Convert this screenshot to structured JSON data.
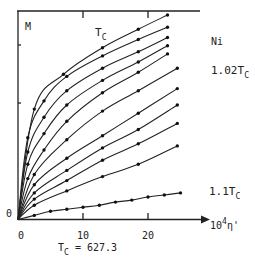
{
  "chart_data": {
    "type": "line",
    "title": "",
    "material_label": "Ni",
    "ylabel": "M",
    "xlabel": "10^4 η'",
    "xlabel_base": "10",
    "xlabel_exp": "4",
    "xlabel_var": "η'",
    "x_ticks": [
      "0",
      "10",
      "20"
    ],
    "y_ticks": [
      "0"
    ],
    "xlim": [
      0,
      27
    ],
    "annotation_tc": "T = 627.3",
    "annotation_tc_parts": {
      "T": "T",
      "sub": "C",
      "rest": " = 627.3"
    },
    "curve_labels": [
      {
        "text": "T",
        "sub": "C",
        "curve": "T_C"
      },
      {
        "text": "1.02T",
        "sub": "C",
        "curve": "1.02T_C"
      },
      {
        "text": "1.1T",
        "sub": "C",
        "curve": "1.1T_C"
      }
    ],
    "grid": false,
    "legend": "none",
    "series": [
      {
        "name": "T_C",
        "x": [
          0,
          2.5,
          7,
          13,
          18.5,
          23
        ],
        "y": [
          0,
          0.54,
          0.71,
          0.84,
          0.93,
          1.0
        ]
      },
      {
        "name": "curve-2",
        "x": [
          0,
          1.5,
          4,
          7.5,
          13,
          18.5,
          23
        ],
        "y": [
          0,
          0.4,
          0.58,
          0.7,
          0.8,
          0.88,
          0.94
        ]
      },
      {
        "name": "curve-3",
        "x": [
          0,
          1.5,
          4,
          7.5,
          13,
          18.5,
          23
        ],
        "y": [
          0,
          0.33,
          0.5,
          0.63,
          0.74,
          0.82,
          0.89
        ]
      },
      {
        "name": "curve-4",
        "x": [
          0,
          1.5,
          4,
          7.5,
          13,
          18.5,
          23
        ],
        "y": [
          0,
          0.27,
          0.42,
          0.56,
          0.68,
          0.77,
          0.85
        ]
      },
      {
        "name": "curve-5",
        "x": [
          0,
          1.5,
          4,
          7.5,
          13,
          18.5,
          23
        ],
        "y": [
          0,
          0.2,
          0.34,
          0.48,
          0.62,
          0.72,
          0.81
        ]
      },
      {
        "name": "1.02T_C",
        "x": [
          0,
          2.5,
          7.5,
          13,
          18.5,
          24.5
        ],
        "y": [
          0,
          0.22,
          0.39,
          0.53,
          0.63,
          0.74
        ]
      },
      {
        "name": "curve-7",
        "x": [
          0,
          2.5,
          7.5,
          13,
          18.5,
          24.5
        ],
        "y": [
          0,
          0.17,
          0.3,
          0.41,
          0.52,
          0.64
        ]
      },
      {
        "name": "curve-8",
        "x": [
          0,
          2.5,
          7.5,
          13,
          18.5,
          24.5
        ],
        "y": [
          0,
          0.13,
          0.24,
          0.35,
          0.44,
          0.56
        ]
      },
      {
        "name": "curve-9",
        "x": [
          0,
          2.5,
          7.5,
          13,
          18.5,
          24.5
        ],
        "y": [
          0,
          0.1,
          0.19,
          0.29,
          0.37,
          0.47
        ]
      },
      {
        "name": "curve-10",
        "x": [
          0,
          2.5,
          7.5,
          13,
          18.5,
          24.5
        ],
        "y": [
          0,
          0.07,
          0.14,
          0.21,
          0.27,
          0.36
        ]
      },
      {
        "name": "1.1T_C",
        "x": [
          0,
          2.5,
          5,
          7.5,
          10,
          12.5,
          15,
          17.5,
          20,
          22.5,
          25
        ],
        "y": [
          0,
          0.02,
          0.04,
          0.05,
          0.06,
          0.07,
          0.085,
          0.095,
          0.11,
          0.12,
          0.13
        ]
      }
    ]
  }
}
